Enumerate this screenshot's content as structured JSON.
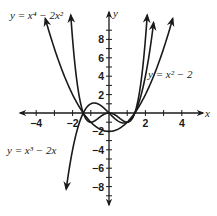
{
  "chart_data": {
    "type": "line",
    "title": "",
    "xlabel": "x",
    "ylabel": "y",
    "xlim": [
      -4.8,
      4.5
    ],
    "ylim": [
      -9.8,
      10.7
    ],
    "x_ticks": [
      -4,
      -3,
      -2,
      -1,
      1,
      2,
      3,
      4
    ],
    "x_tick_labels": [
      "-4",
      "-2",
      "2",
      "4"
    ],
    "y_ticks": [
      -9,
      -8,
      -7,
      -6,
      -5,
      -4,
      -3,
      -2,
      -1,
      1,
      2,
      3,
      4,
      5,
      6,
      7,
      8,
      9
    ],
    "y_tick_labels": [
      "8",
      "6",
      "4",
      "2",
      "-2",
      "-4",
      "-6",
      "-8"
    ],
    "grid": false,
    "series": [
      {
        "name": "y = x^4 - 2x^2",
        "expr": "x^4-2x^2",
        "domain": [
          -2.1,
          2.1
        ],
        "label": "y = x⁴ − 2x²",
        "label_pos": "top-left"
      },
      {
        "name": "y = x^2 - 2",
        "expr": "x^2-2",
        "domain": [
          -3.5,
          3.5
        ],
        "label": "y = x² − 2",
        "label_pos": "right"
      },
      {
        "name": "y = x^3 - 2x",
        "expr": "x^3-2x",
        "domain": [
          -2.35,
          2.45
        ],
        "label": "y = x³ − 2x",
        "label_pos": "left"
      }
    ]
  },
  "axes": {
    "x_name": "x",
    "y_name": "y"
  },
  "labels": {
    "quartic": "y = x⁴ − 2x²",
    "parabola": "y = x² − 2",
    "cubic": "y = x³ − 2x"
  },
  "colors": {
    "ink": "#1a1a1a",
    "background": "#ffffff"
  }
}
